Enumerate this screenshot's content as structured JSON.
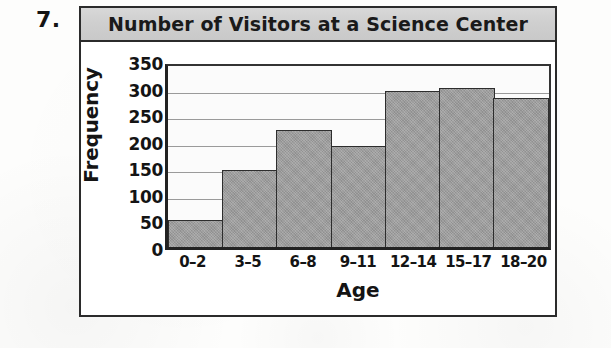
{
  "item_number": "7.",
  "chart_data": {
    "type": "bar",
    "title": "Number of Visitors at a Science Center",
    "xlabel": "Age",
    "ylabel": "Frequency",
    "categories": [
      "0–2",
      "3–5",
      "6–8",
      "9–11",
      "12–14",
      "15–17",
      "18–20"
    ],
    "values": [
      50,
      145,
      220,
      190,
      293,
      300,
      280
    ],
    "ylim": [
      0,
      350
    ],
    "ytick_labels": [
      "350",
      "300",
      "250",
      "200",
      "150",
      "100",
      "50",
      "0"
    ],
    "ytick_values": [
      350,
      300,
      250,
      200,
      150,
      100,
      50,
      0
    ],
    "ytick_step": 50,
    "grid": true,
    "legend": "none",
    "bar_fill_color": "#9c9c9c",
    "bar_edge_color": "#2d2d2d",
    "title_band_color": "#cfcfcf",
    "frame_color": "#2b2b2b"
  }
}
